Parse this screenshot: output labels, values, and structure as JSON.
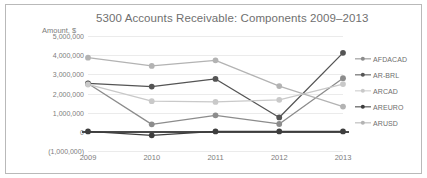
{
  "chart_data": {
    "type": "line",
    "title": "5300 Accounts Receivable: Components 2009–2013",
    "xlabel": "",
    "ylabel": "Amount, $",
    "categories": [
      "2009",
      "2010",
      "2011",
      "2012",
      "2013"
    ],
    "ylim": [
      -1000000,
      5000000
    ],
    "ytick_labels": [
      "5,000,000",
      "4,000,000",
      "3,000,000",
      "2,000,000",
      "1,000,000",
      "0",
      "(1,000,000)"
    ],
    "ytick_values": [
      5000000,
      4000000,
      3000000,
      2000000,
      1000000,
      0,
      -1000000
    ],
    "grid": true,
    "legend_position": "right",
    "series": [
      {
        "name": "AFDACAD",
        "color": "#8c8c8c",
        "values": [
          2520000,
          390000,
          860000,
          410000,
          2800000
        ]
      },
      {
        "name": "AR-BRL",
        "color": "#545454",
        "values": [
          2530000,
          2360000,
          2760000,
          750000,
          4120000
        ]
      },
      {
        "name": "ARCAD",
        "color": "#c9c9c9",
        "values": [
          2470000,
          1600000,
          1560000,
          1670000,
          2490000
        ]
      },
      {
        "name": "AREURO",
        "color": "#3d3d3d",
        "values": [
          20000,
          -180000,
          20000,
          20000,
          20000
        ]
      },
      {
        "name": "ARUSD",
        "color": "#b3b3b3",
        "values": [
          3870000,
          3440000,
          3730000,
          2390000,
          1320000
        ]
      }
    ]
  },
  "legend": {
    "items": [
      {
        "label": "AFDACAD"
      },
      {
        "label": "AR-BRL"
      },
      {
        "label": "ARCAD"
      },
      {
        "label": "AREURO"
      },
      {
        "label": "ARUSD"
      }
    ]
  }
}
